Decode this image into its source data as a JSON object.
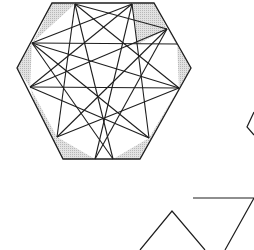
{
  "figure": {
    "colors": {
      "background": "#ffffff",
      "stroke": "#1e1e1e",
      "fill": "#d4d4d4"
    },
    "hexagon": {
      "points": [
        [
          52,
          3
        ],
        [
          154,
          3
        ],
        [
          191,
          68
        ],
        [
          140,
          159
        ],
        [
          63,
          159
        ],
        [
          17,
          68
        ]
      ]
    },
    "star_points": {
      "A": [
        75,
        4
      ],
      "B": [
        132,
        4
      ],
      "C": [
        167,
        29
      ],
      "D": [
        179,
        88
      ],
      "E": [
        149,
        138
      ],
      "F": [
        95,
        159
      ],
      "G": [
        113,
        159
      ],
      "H": [
        57,
        137
      ],
      "I": [
        30,
        87
      ],
      "J": [
        32,
        43
      ]
    },
    "shaded_regions": [
      [
        [
          52,
          3
        ],
        [
          75,
          4
        ],
        [
          32,
          43
        ],
        [
          40,
          29
        ]
      ],
      [
        [
          132,
          4
        ],
        [
          154,
          3
        ],
        [
          167,
          29
        ],
        [
          138,
          44
        ]
      ],
      [
        [
          17,
          68
        ],
        [
          32,
          43
        ],
        [
          30,
          87
        ]
      ],
      [
        [
          191,
          68
        ],
        [
          167,
          29
        ],
        [
          177,
          44
        ],
        [
          179,
          88
        ]
      ],
      [
        [
          30,
          87
        ],
        [
          57,
          137
        ],
        [
          63,
          159
        ],
        [
          40,
          120
        ]
      ],
      [
        [
          179,
          88
        ],
        [
          149,
          138
        ],
        [
          140,
          159
        ],
        [
          165,
          113
        ]
      ],
      [
        [
          57,
          137
        ],
        [
          95,
          159
        ],
        [
          63,
          159
        ]
      ],
      [
        [
          113,
          159
        ],
        [
          149,
          138
        ],
        [
          140,
          159
        ]
      ]
    ],
    "lines": [
      [
        [
          75,
          4
        ],
        [
          57,
          137
        ]
      ],
      [
        [
          75,
          4
        ],
        [
          113,
          159
        ]
      ],
      [
        [
          75,
          4
        ],
        [
          179,
          88
        ]
      ],
      [
        [
          75,
          4
        ],
        [
          167,
          29
        ]
      ],
      [
        [
          132,
          4
        ],
        [
          149,
          138
        ]
      ],
      [
        [
          132,
          4
        ],
        [
          95,
          159
        ]
      ],
      [
        [
          132,
          4
        ],
        [
          30,
          87
        ]
      ],
      [
        [
          132,
          4
        ],
        [
          32,
          43
        ]
      ],
      [
        [
          32,
          43
        ],
        [
          177,
          44
        ]
      ],
      [
        [
          30,
          87
        ],
        [
          179,
          88
        ]
      ],
      [
        [
          32,
          43
        ],
        [
          149,
          138
        ]
      ],
      [
        [
          167,
          29
        ],
        [
          57,
          137
        ]
      ],
      [
        [
          30,
          87
        ],
        [
          167,
          29
        ]
      ],
      [
        [
          179,
          88
        ],
        [
          32,
          43
        ]
      ],
      [
        [
          57,
          137
        ],
        [
          179,
          88
        ]
      ],
      [
        [
          149,
          138
        ],
        [
          30,
          87
        ]
      ],
      [
        [
          95,
          159
        ],
        [
          167,
          29
        ]
      ],
      [
        [
          113,
          159
        ],
        [
          32,
          43
        ]
      ]
    ],
    "triangles": [
      {
        "name": "upward-triangle",
        "points": [
          [
            140,
            250
          ],
          [
            172,
            211
          ],
          [
            205,
            250
          ]
        ]
      },
      {
        "name": "downward-triangle",
        "points": [
          [
            193,
            198
          ],
          [
            254,
            198
          ],
          [
            225,
            250
          ]
        ]
      },
      {
        "name": "partial-shape-right",
        "points": [
          [
            254,
            112
          ],
          [
            247,
            127
          ],
          [
            254,
            135
          ]
        ]
      }
    ]
  }
}
